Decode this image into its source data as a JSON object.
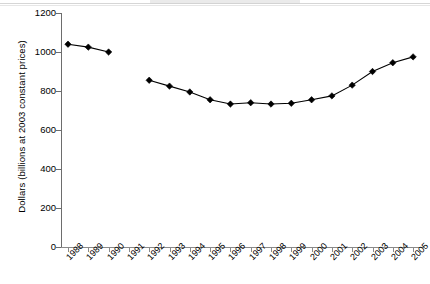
{
  "chart_data": {
    "type": "line",
    "title": "",
    "xlabel": "",
    "ylabel": "Dollars (billions at 2003 constant prices)",
    "categories": [
      "1988",
      "1989",
      "1990",
      "1991",
      "1992",
      "1993",
      "1994",
      "1995",
      "1996",
      "1997",
      "1998",
      "1999",
      "2000",
      "2001",
      "2002",
      "2003",
      "2004",
      "2005"
    ],
    "values": [
      1040,
      1025,
      1000,
      null,
      855,
      825,
      795,
      755,
      733,
      740,
      733,
      737,
      755,
      775,
      830,
      900,
      945,
      975
    ],
    "series": [
      {
        "name": "Dollars (billions at 2003 constant prices)",
        "values": [
          1040,
          1025,
          1000,
          null,
          855,
          825,
          795,
          755,
          733,
          740,
          733,
          737,
          755,
          775,
          830,
          900,
          945,
          975
        ]
      }
    ],
    "ylim": [
      0,
      1200
    ],
    "ytick_values": [
      0,
      200,
      400,
      600,
      800,
      1000,
      1200
    ],
    "ytick_labels": [
      "0",
      "200",
      "400",
      "600",
      "800",
      "1000",
      "1200"
    ],
    "grid": false,
    "legend": false,
    "legend_position": "none",
    "marker": "diamond",
    "marker_color": "#000000",
    "line_color": "#000000",
    "note_gap": "1991 has no data point"
  },
  "axes": {
    "y_title": "Dollars (billions at 2003 constant prices)"
  }
}
